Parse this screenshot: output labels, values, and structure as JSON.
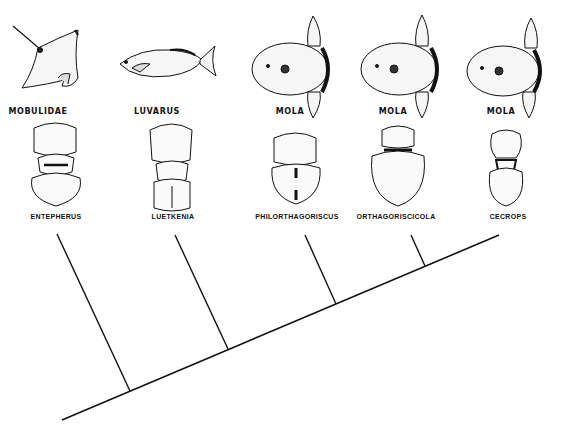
{
  "diagram": {
    "type": "host-parasite cladogram",
    "hosts": [
      {
        "label": "MOBULIDAE",
        "icon": "manta-ray-icon",
        "x": 38
      },
      {
        "label": "LUVARUS",
        "icon": "luvarus-fish-icon",
        "x": 157
      },
      {
        "label": "MOLA",
        "icon": "mola-sunfish-icon",
        "x": 290
      },
      {
        "label": "MOLA",
        "icon": "mola-sunfish-icon",
        "x": 393
      },
      {
        "label": "MOLA",
        "icon": "mola-sunfish-icon",
        "x": 501
      }
    ],
    "parasites": [
      {
        "label": "ENTEPHERUS",
        "icon": "copepod-icon",
        "x": 56
      },
      {
        "label": "LUETKENIA",
        "icon": "copepod-icon",
        "x": 173
      },
      {
        "label": "PHILORTHAGORISCUS",
        "icon": "copepod-icon",
        "x": 297
      },
      {
        "label": "ORTHAGORISCICOLA",
        "icon": "copepod-icon",
        "x": 396
      },
      {
        "label": "CECROPS",
        "icon": "copepod-icon",
        "x": 508
      }
    ],
    "tree": {
      "stroke": "#111111",
      "root_line": {
        "x1": 62,
        "y1": 420,
        "x2": 499,
        "y2": 235
      },
      "branches": [
        {
          "to": "ENTEPHERUS",
          "x1": 130,
          "y1": 391,
          "x2": 57,
          "y2": 234
        },
        {
          "to": "LUETKENIA",
          "x1": 228,
          "y1": 349,
          "x2": 175,
          "y2": 235
        },
        {
          "to": "PHILORTHAGORISCUS",
          "x1": 336,
          "y1": 304,
          "x2": 305,
          "y2": 235
        },
        {
          "to": "ORTHAGORISCICOLA",
          "x1": 425,
          "y1": 266,
          "x2": 411,
          "y2": 235
        }
      ]
    }
  }
}
